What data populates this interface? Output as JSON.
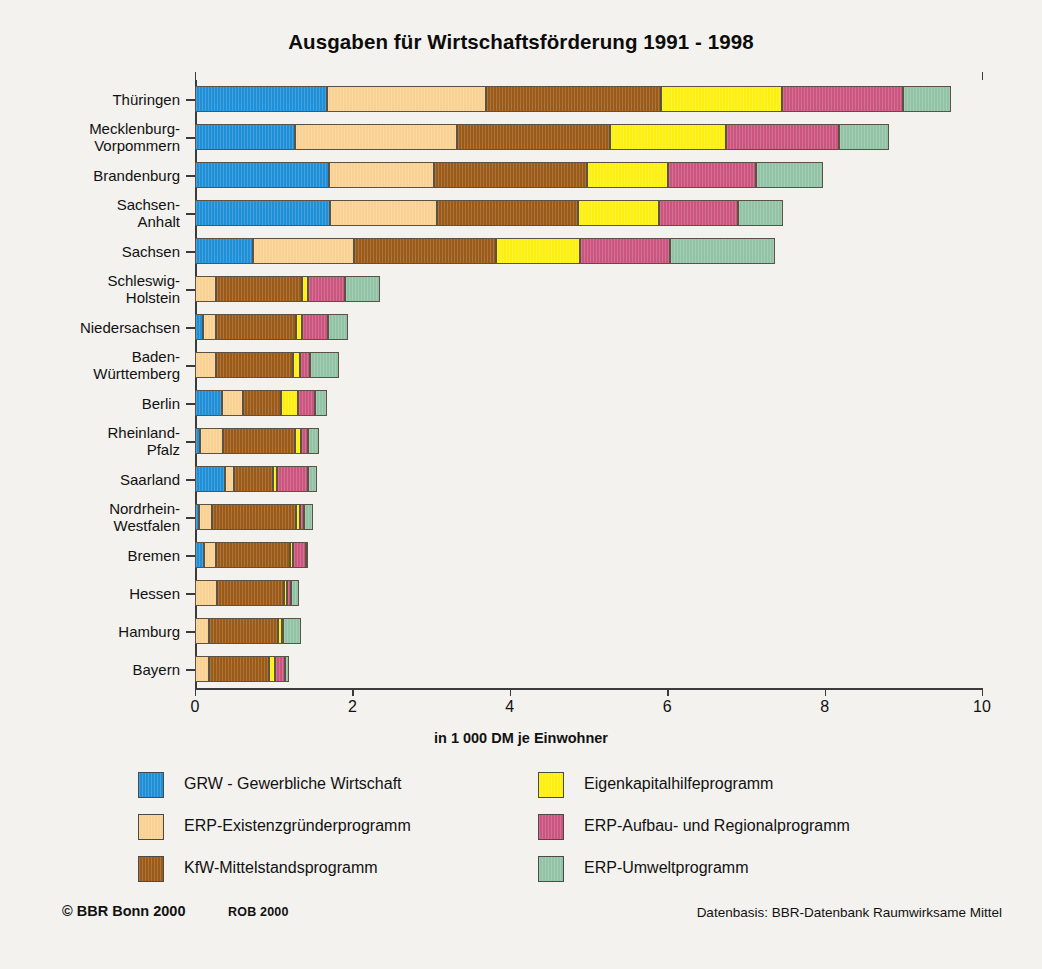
{
  "title": "Ausgaben für Wirtschaftsförderung 1991 - 1998",
  "axis_title": "in 1 000 DM je Einwohner",
  "footer": {
    "copyright": "© BBR Bonn 2000",
    "rob": "ROB 2000",
    "source": "Datenbasis: BBR-Datenbank Raumwirksame Mittel"
  },
  "legend": [
    {
      "label": "GRW - Gewerbliche Wirtschaft",
      "color": "#1f8fd8"
    },
    {
      "label": "ERP-Existenzgründerprogramm",
      "color": "#f8d193"
    },
    {
      "label": "KfW-Mittelstandsprogramm",
      "color": "#9c5a18"
    },
    {
      "label": "Eigenkapitalhilfeprogramm",
      "color": "#fdf00e"
    },
    {
      "label": "ERP-Aufbau- und Regionalprogramm",
      "color": "#cc5580"
    },
    {
      "label": "ERP-Umweltprogramm",
      "color": "#93c3a6"
    }
  ],
  "chart_data": {
    "type": "bar",
    "orientation": "horizontal",
    "stacked": true,
    "title": "Ausgaben für Wirtschaftsförderung 1991 - 1998",
    "xlabel": "in 1 000 DM je Einwohner",
    "ylabel": "",
    "xlim": [
      0,
      10
    ],
    "xticks": [
      0,
      2,
      4,
      6,
      8,
      10
    ],
    "grid": false,
    "legend_position": "bottom",
    "categories": [
      "Thüringen",
      "Mecklenburg-\nVorpommern",
      "Brandenburg",
      "Sachsen-\nAnhalt",
      "Sachsen",
      "Schleswig-\nHolstein",
      "Niedersachsen",
      "Baden-\nWürttemberg",
      "Berlin",
      "Rheinland-\nPfalz",
      "Saarland",
      "Nordrhein-\nWestfalen",
      "Bremen",
      "Hessen",
      "Hamburg",
      "Bayern"
    ],
    "series": [
      {
        "name": "GRW - Gewerbliche Wirtschaft",
        "color": "#1f8fd8",
        "values": [
          1.68,
          1.27,
          1.7,
          1.72,
          0.74,
          0.0,
          0.1,
          0.0,
          0.34,
          0.06,
          0.38,
          0.05,
          0.11,
          0.0,
          0.0,
          0.0
        ]
      },
      {
        "name": "ERP-Existenzgründerprogramm",
        "color": "#f8d193",
        "values": [
          2.02,
          2.06,
          1.34,
          1.36,
          1.28,
          0.27,
          0.17,
          0.27,
          0.27,
          0.3,
          0.11,
          0.17,
          0.16,
          0.28,
          0.18,
          0.18
        ]
      },
      {
        "name": "KfW-Mittelstandsprogramm",
        "color": "#9c5a18",
        "values": [
          2.22,
          1.94,
          1.94,
          1.79,
          1.8,
          1.09,
          1.01,
          0.97,
          0.48,
          0.91,
          0.5,
          1.06,
          0.94,
          0.85,
          0.88,
          0.76
        ]
      },
      {
        "name": "Eigenkapitalhilfeprogramm",
        "color": "#fdf00e",
        "values": [
          1.54,
          1.48,
          1.03,
          1.03,
          1.07,
          0.08,
          0.08,
          0.09,
          0.22,
          0.08,
          0.05,
          0.05,
          0.03,
          0.04,
          0.04,
          0.08
        ]
      },
      {
        "name": "ERP-Aufbau- und Regionalprogramm",
        "color": "#cc5580",
        "values": [
          1.53,
          1.43,
          1.12,
          1.0,
          1.15,
          0.47,
          0.33,
          0.13,
          0.21,
          0.08,
          0.4,
          0.05,
          0.17,
          0.05,
          0.02,
          0.12
        ]
      },
      {
        "name": "ERP-Umweltprogramm",
        "color": "#93c3a6",
        "values": [
          0.61,
          0.64,
          0.85,
          0.57,
          1.33,
          0.44,
          0.26,
          0.37,
          0.16,
          0.15,
          0.11,
          0.12,
          0.03,
          0.1,
          0.23,
          0.05
        ]
      }
    ],
    "totals": [
      9.6,
      8.82,
      7.98,
      7.47,
      7.37,
      2.35,
      1.95,
      1.83,
      1.68,
      1.58,
      1.55,
      1.5,
      1.44,
      1.32,
      1.33,
      1.19
    ]
  }
}
